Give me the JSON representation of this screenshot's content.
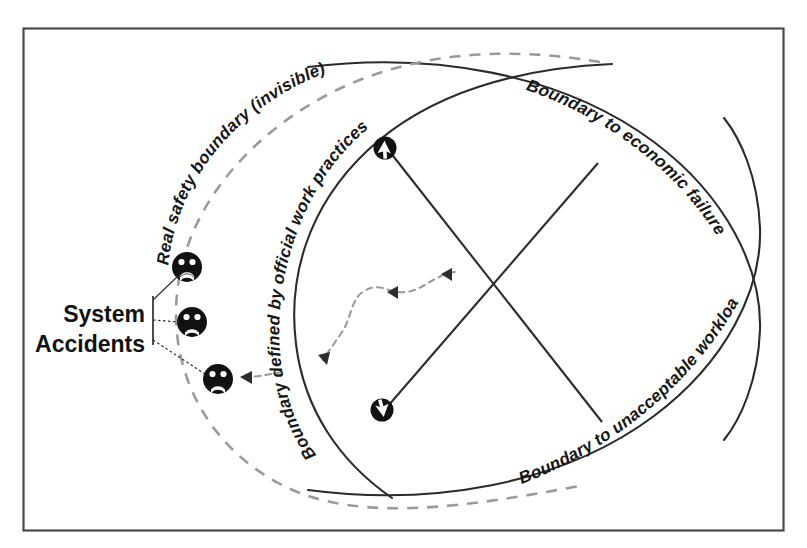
{
  "figure": {
    "kind": "rasmussen-migration-to-boundary-diagram",
    "frame_color": "#4a4a4a",
    "background": "#ffffff"
  },
  "labels": {
    "real_safety_boundary": "Real safety boundary (invisible)",
    "official_work_practices": "Boundary defined by official work practices",
    "economic_failure": "Boundary to economic failure",
    "unacceptable_workload": "Boundary to unacceptable workload",
    "system_accidents_line1": "System",
    "system_accidents_line2": "Accidents"
  },
  "colors": {
    "solid_boundary": "#2b2b2b",
    "dashed_safety_boundary": "#9a9a9a",
    "migration_arrow": "#8f8f8f",
    "accident_face": "#111111",
    "leader_line": "#3a3a3a",
    "diagonal_line": "#2b2b2b"
  },
  "markers": {
    "accident_faces": [
      {
        "id": "accident-face-top",
        "cx": 187,
        "cy": 267
      },
      {
        "id": "accident-face-middle",
        "cx": 192,
        "cy": 322
      },
      {
        "id": "accident-face-bottom",
        "cx": 218,
        "cy": 379
      }
    ],
    "operating_points": [
      {
        "id": "operating-point-upper",
        "cx": 385,
        "cy": 148,
        "arrow": "up-left"
      },
      {
        "id": "operating-point-lower",
        "cx": 382,
        "cy": 410,
        "arrow": "down-left"
      }
    ]
  }
}
